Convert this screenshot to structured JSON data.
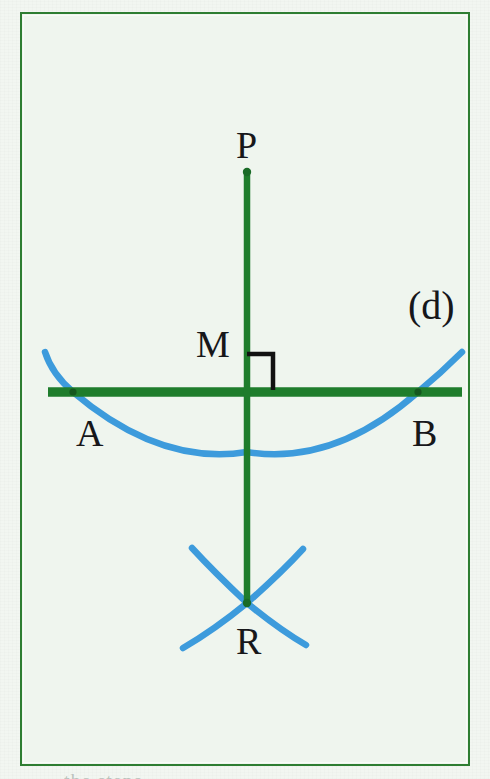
{
  "figure": {
    "caption_label": "(d)",
    "bottom_cut_caption": "the steps",
    "background_color": "#eff5ee",
    "frame_color": "#2e7d32",
    "construction_color": "#1a7a2e",
    "arc_color": "#3d9bdc",
    "label_color": "#17171a"
  },
  "points": [
    {
      "id": "P",
      "label": "P",
      "x": 247,
      "y": 170,
      "role": "external-point"
    },
    {
      "id": "M",
      "label": "M",
      "x": 247,
      "y": 392,
      "role": "foot-of-perpendicular"
    },
    {
      "id": "A",
      "label": "A",
      "x": 73,
      "y": 392,
      "role": "arc-line-intersection-left"
    },
    {
      "id": "B",
      "label": "B",
      "x": 418,
      "y": 392,
      "role": "arc-line-intersection-right"
    },
    {
      "id": "R",
      "label": "R",
      "x": 247,
      "y": 603,
      "role": "arc-arc-intersection-below"
    }
  ],
  "segments": [
    {
      "id": "PR",
      "from": "P",
      "to": "R",
      "orientation": "vertical",
      "color": "#1a7a2e",
      "width": 6
    },
    {
      "id": "line-d",
      "label": "(d)",
      "orientation": "horizontal",
      "x1": 48,
      "x2": 462,
      "y": 392,
      "color": "#1a7a2e",
      "width": 9
    }
  ],
  "arcs": [
    {
      "id": "arc-AB",
      "center": "P",
      "through": [
        "A",
        "B"
      ],
      "color": "#3d9bdc",
      "width": 6,
      "description": "wide arc from P cutting line (d) at A and B"
    },
    {
      "id": "arc-from-A",
      "center": "A",
      "through": [
        "R"
      ],
      "color": "#3d9bdc",
      "width": 6,
      "description": "small arc centered at A meeting at R"
    },
    {
      "id": "arc-from-B",
      "center": "B",
      "through": [
        "R"
      ],
      "color": "#3d9bdc",
      "width": 6,
      "description": "small arc centered at B meeting at R"
    }
  ],
  "marks": [
    {
      "id": "right-angle-M",
      "type": "right-angle",
      "at": "M",
      "color": "#111111",
      "size": 26,
      "opens": "upper-right"
    }
  ]
}
